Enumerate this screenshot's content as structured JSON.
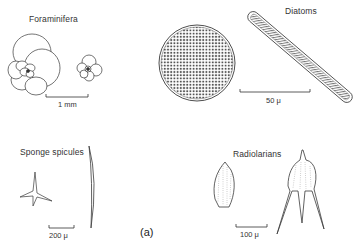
{
  "figure": {
    "panel_label": "(a)",
    "groups": [
      {
        "name": "Foraminifera",
        "scale_bar": "1 mm"
      },
      {
        "name": "Diatoms",
        "scale_bar": "50 μ"
      },
      {
        "name": "Sponge spicules",
        "scale_bar": "200 μ"
      },
      {
        "name": "Radiolarians",
        "scale_bar": "100 μ"
      }
    ]
  },
  "colors": {
    "line": "#3a3a3a",
    "background": "#ffffff"
  }
}
